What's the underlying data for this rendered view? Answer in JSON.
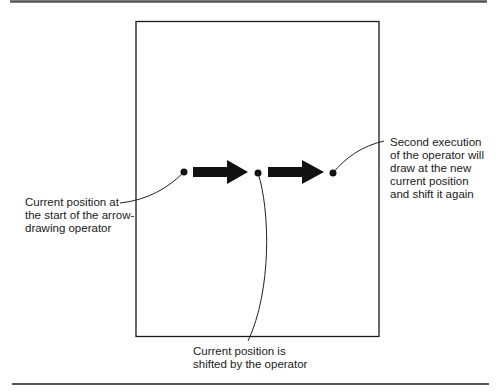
{
  "diagram": {
    "page": {
      "x": 136,
      "y": 21,
      "width": 243,
      "height": 315
    },
    "rules": {
      "top": {
        "x1": 10,
        "x2": 487,
        "y": 1.5
      },
      "bottom": {
        "x1": 12,
        "x2": 489,
        "y": 384
      }
    },
    "points": [
      {
        "id": "start",
        "cx": 184,
        "cy": 172,
        "r": 3.5
      },
      {
        "id": "shifted",
        "cx": 258,
        "cy": 173,
        "r": 3.5
      },
      {
        "id": "second",
        "cx": 333,
        "cy": 173,
        "r": 3.5
      }
    ],
    "arrows": [
      {
        "id": "arrow-1",
        "x1": 193,
        "x2": 248,
        "cy": 172
      },
      {
        "id": "arrow-2",
        "x1": 268,
        "x2": 324,
        "cy": 172
      }
    ],
    "colors": {
      "ink": "#111111",
      "rule": "#555555",
      "text": "#1a1a1a"
    }
  },
  "labels": {
    "left": "Current position at\nthe start of the arrow-\ndrawing operator",
    "right": "Second execution\nof the operator will\ndraw at the new\ncurrent position\nand shift it again",
    "bottom": "Current position is\nshifted by the operator"
  }
}
